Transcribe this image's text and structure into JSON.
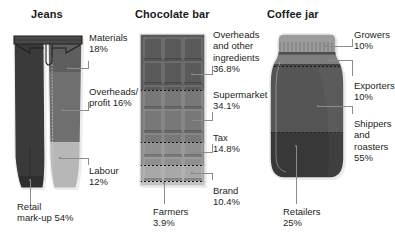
{
  "figure": {
    "type": "infographic"
  },
  "panels": [
    {
      "id": "jeans",
      "title": "Jeans",
      "icon": "jeans-icon",
      "segments": [
        {
          "name": "Materials",
          "label": "Materials\n18%",
          "value": 18,
          "unit": "%",
          "color": "#5e5e5e"
        },
        {
          "name": "Overheads/profit",
          "label": "Overheads/\nprofit 16%",
          "value": 16,
          "unit": "%",
          "color": "#7a7a7a"
        },
        {
          "name": "Labour",
          "label": "Labour\n12%",
          "value": 12,
          "unit": "%",
          "color": "#b7b7b7"
        },
        {
          "name": "Retail mark-up",
          "label": "Retail\nmark-up 54%",
          "value": 54,
          "unit": "%",
          "color": "#3a3a3a"
        }
      ]
    },
    {
      "id": "chocolate-bar",
      "title": "Chocolate bar",
      "icon": "chocolate-bar-icon",
      "segments": [
        {
          "name": "Overheads and other ingredients",
          "label": "Overheads\nand other\ningredients\n36.8%",
          "value": 36.8,
          "unit": "%",
          "color": "#5a5a5a"
        },
        {
          "name": "Supermarket",
          "label": "Supermarket\n34.1%",
          "value": 34.1,
          "unit": "%",
          "color": "#787878"
        },
        {
          "name": "Tax",
          "label": "Tax\n14.8%",
          "value": 14.8,
          "unit": "%",
          "color": "#8f8f8f"
        },
        {
          "name": "Brand",
          "label": "Brand\n10.4%",
          "value": 10.4,
          "unit": "%",
          "color": "#a8a8a8"
        },
        {
          "name": "Farmers",
          "label": "Farmers\n3.9%",
          "value": 3.9,
          "unit": "%",
          "color": "#c4c4c4"
        }
      ]
    },
    {
      "id": "coffee-jar",
      "title": "Coffee jar",
      "icon": "coffee-jar-icon",
      "segments": [
        {
          "name": "Growers",
          "label": "Growers\n10%",
          "value": 10,
          "unit": "%",
          "color": "#9c9c9c"
        },
        {
          "name": "Exporters",
          "label": "Exporters\n10%",
          "value": 10,
          "unit": "%",
          "color": "#7e7e7e"
        },
        {
          "name": "Shippers and roasters",
          "label": "Shippers\nand\nroasters\n55%",
          "value": 55,
          "unit": "%",
          "color": "#555555"
        },
        {
          "name": "Retailers",
          "label": "Retailers\n25%",
          "value": 25,
          "unit": "%",
          "color": "#3c3c3c"
        }
      ]
    }
  ]
}
